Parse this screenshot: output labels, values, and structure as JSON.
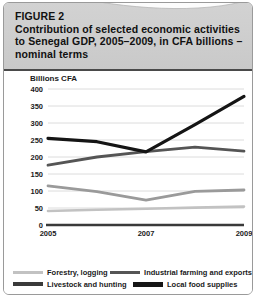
{
  "figure": {
    "label": "FIGURE 2",
    "title_lines": [
      "Contribution of selected economic activities",
      "to Senegal GDP, 2005–2009, in CFA billions –",
      "nominal terms"
    ],
    "axis_unit": "Billions CFA"
  },
  "chart_data": {
    "type": "line",
    "title": "Contribution of selected economic activities to Senegal GDP, 2005–2009, in CFA billions – nominal terms",
    "xlabel": "",
    "ylabel": "Billions CFA",
    "x": [
      2005,
      2006,
      2007,
      2008,
      2009
    ],
    "xtick_labels": [
      "2005",
      "2007",
      "2009"
    ],
    "xtick_values": [
      2005,
      2007,
      2009
    ],
    "ytick_labels": [
      "0",
      "50",
      "100",
      "150",
      "200",
      "250",
      "300",
      "350",
      "400"
    ],
    "ytick_values": [
      0,
      50,
      100,
      150,
      200,
      250,
      300,
      350,
      400
    ],
    "ylim": [
      0,
      400
    ],
    "grid": "horizontal",
    "legend_position": "bottom",
    "series": [
      {
        "name": "Forestry, logging",
        "values": [
          41,
          45,
          48,
          51,
          54
        ],
        "color": "#c2c2c2",
        "width": 2.6
      },
      {
        "name": "Industrial farming and exports",
        "values": [
          176,
          200,
          216,
          229,
          217
        ],
        "color": "#555555",
        "width": 2.8
      },
      {
        "name": "Livestock and hunting",
        "values": [
          115,
          98,
          73,
          99,
          103
        ],
        "color": "#9a9a9a",
        "width": 2.8
      },
      {
        "name": "Local food supplies",
        "values": [
          255,
          245,
          215,
          295,
          378
        ],
        "color": "#151515",
        "width": 3.2
      }
    ]
  },
  "legend": {
    "entries": [
      {
        "label": "Forestry, logging",
        "color": "#c2c2c2",
        "width": 3
      },
      {
        "label": "Industrial farming and exports",
        "color": "#555555",
        "width": 3
      },
      {
        "label": "Livestock and hunting",
        "color": "#3a3a3a",
        "width": 4
      },
      {
        "label": "Local food supplies",
        "color": "#151515",
        "width": 5
      }
    ]
  },
  "colors": {
    "header_bg": "#cfcfcf",
    "header_rule": "#4a4a4a",
    "border": "#9a9a9a",
    "grid": "#dcdcdc",
    "axis": "#3a3a3a",
    "text": "#1a1a1a"
  }
}
